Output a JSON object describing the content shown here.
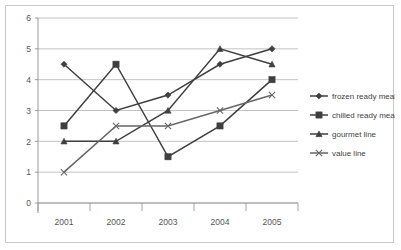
{
  "chart_data": {
    "type": "line",
    "title": "",
    "subtitle": "",
    "xlabel": "",
    "ylabel": "",
    "categories": [
      "2001",
      "2002",
      "2003",
      "2004",
      "2005"
    ],
    "ylim": [
      0,
      6
    ],
    "yticks": [
      0,
      1,
      2,
      3,
      4,
      5,
      6
    ],
    "ytick_labels": [
      "0",
      "1",
      "2",
      "3",
      "4",
      "5",
      "6"
    ],
    "grid": true,
    "grid_axis": "y",
    "legend_position": "right",
    "series": [
      {
        "name": "frozen ready meals",
        "marker": "diamond",
        "color": "#3f3f3f",
        "values": [
          4.5,
          3.0,
          3.5,
          4.5,
          5.0
        ]
      },
      {
        "name": "chilled ready meals",
        "marker": "square",
        "color": "#3f3f3f",
        "values": [
          2.5,
          4.5,
          1.5,
          2.5,
          4.0
        ]
      },
      {
        "name": "gourmet line",
        "marker": "triangle",
        "color": "#3f3f3f",
        "values": [
          2.0,
          2.0,
          3.0,
          5.0,
          4.5
        ]
      },
      {
        "name": "value line",
        "marker": "x",
        "color": "#666666",
        "values": [
          1.0,
          2.5,
          2.5,
          3.0,
          3.5
        ]
      }
    ]
  },
  "axes": {
    "y_tick_0": "0",
    "y_tick_1": "1",
    "y_tick_2": "2",
    "y_tick_3": "3",
    "y_tick_4": "4",
    "y_tick_5": "5",
    "y_tick_6": "6",
    "x_tick_0": "2001",
    "x_tick_1": "2002",
    "x_tick_2": "2003",
    "x_tick_3": "2004",
    "x_tick_4": "2005"
  },
  "legend": {
    "items": [
      {
        "label": "frozen ready meals",
        "marker": "diamond-marker-icon"
      },
      {
        "label": "chilled ready meals",
        "marker": "square-marker-icon"
      },
      {
        "label": "gourmet line",
        "marker": "triangle-marker-icon"
      },
      {
        "label": "value line",
        "marker": "x-marker-icon"
      }
    ]
  },
  "colors": {
    "line": "#3f3f3f",
    "value_line": "#666666",
    "grid": "#b5b5b5",
    "axis": "#9a9a9a",
    "border": "#c9c9c9",
    "background": "#ffffff",
    "text": "#555555"
  }
}
